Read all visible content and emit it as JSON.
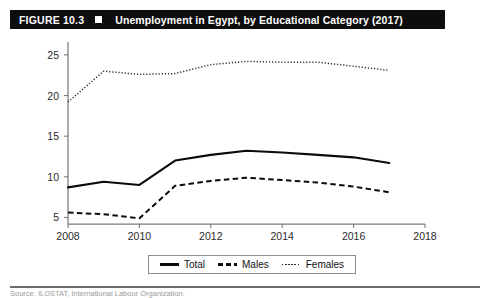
{
  "header": {
    "figure_number": "FIGURE 10.3",
    "marker": "black-square-marker",
    "title": "Unemployment in Egypt, by Educational Category (2017)",
    "bar_color": "#0d0d0d",
    "text_color": "#ffffff"
  },
  "legend": {
    "items": [
      {
        "label": "Total",
        "style": "solid",
        "color": "#0b0b0b"
      },
      {
        "label": "Males",
        "style": "dashed",
        "color": "#0b0b0b"
      },
      {
        "label": "Females",
        "style": "dotted",
        "color": "#2e2e2e"
      }
    ]
  },
  "footer": {
    "source_note": "Source: ILOSTAT, International Labour Organization."
  },
  "chart_data": {
    "type": "line",
    "title": "Unemployment in Egypt, by Educational Category (2017)",
    "xlabel": "",
    "ylabel": "",
    "x": [
      2008,
      2009,
      2010,
      2011,
      2012,
      2013,
      2014,
      2015,
      2016,
      2017
    ],
    "xlim": [
      2008,
      2018
    ],
    "ylim": [
      4.2,
      25.6
    ],
    "xticks": [
      2008,
      2010,
      2012,
      2014,
      2016,
      2018
    ],
    "xtick_labels": [
      "2008",
      "2010",
      "2012",
      "2014",
      "2016",
      "2018"
    ],
    "yticks": [
      5,
      10,
      15,
      20,
      25
    ],
    "ytick_labels": [
      "5",
      "10",
      "15",
      "20",
      "25"
    ],
    "grid": false,
    "legend_position": "bottom-center",
    "series": [
      {
        "name": "Total",
        "style": "solid",
        "color": "#0b0b0b",
        "values": [
          8.7,
          9.4,
          9.0,
          12.0,
          12.7,
          13.2,
          13.0,
          12.7,
          12.4,
          11.7
        ]
      },
      {
        "name": "Males",
        "style": "dashed",
        "color": "#0b0b0b",
        "values": [
          5.6,
          5.4,
          4.9,
          8.9,
          9.5,
          9.9,
          9.6,
          9.3,
          8.8,
          8.1
        ]
      },
      {
        "name": "Females",
        "style": "dotted",
        "color": "#2e2e2e",
        "values": [
          19.2,
          23.0,
          22.6,
          22.7,
          23.8,
          24.2,
          24.1,
          24.1,
          23.6,
          23.1
        ]
      }
    ]
  }
}
